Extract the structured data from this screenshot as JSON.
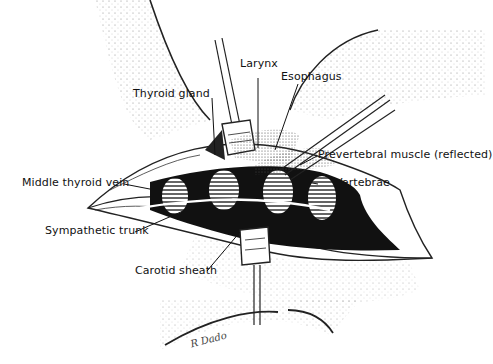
{
  "figure": {
    "labels": {
      "thyroid_gland": "Thyroid gland",
      "larynx": "Larynx",
      "esophagus": "Esophagus",
      "prevertebral_muscle": "Prevertebral muscle (reflected)",
      "vertebrae": "Vertebrae",
      "middle_thyroid_vein": "Middle thyroid vein",
      "sympathetic_trunk": "Sympathetic trunk",
      "carotid_sheath": "Carotid sheath"
    },
    "signature": "R Dado"
  }
}
